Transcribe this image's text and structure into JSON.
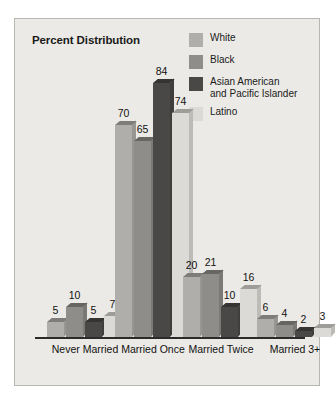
{
  "chart_data": {
    "type": "bar",
    "title": "Percent Distribution",
    "xlabel": "",
    "ylabel": "",
    "ylim": [
      0,
      90
    ],
    "grid": false,
    "legend_position": "top-right",
    "categories": [
      "Never Married",
      "Married Once",
      "Married Twice",
      "Married 3+"
    ],
    "series": [
      {
        "name": "White",
        "color": "#b0aeab",
        "values": [
          5,
          70,
          20,
          6
        ]
      },
      {
        "name": "Black",
        "color": "#8f8d8a",
        "values": [
          10,
          65,
          21,
          4
        ]
      },
      {
        "name": "Asian American\nand Pacific Islander",
        "color": "#4a4846",
        "values": [
          5,
          84,
          10,
          2
        ]
      },
      {
        "name": "Latino",
        "color": "#dcdad6",
        "values": [
          7,
          74,
          16,
          3
        ]
      }
    ]
  },
  "panel": {
    "background": "#eceae6",
    "border_color": "#b9b6b1",
    "axis_color": "#2b2b2b",
    "text_color": "#111111"
  }
}
